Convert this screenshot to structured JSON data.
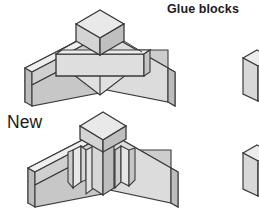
{
  "figure": {
    "title": "Glue blocks",
    "annotation_new": "New",
    "colors": {
      "background": "#ffffff",
      "outline": "#3a3a3a",
      "face_light": "#e6e6e6",
      "face_mid": "#d2d2d2",
      "face_dark": "#b9b9b9",
      "face_top": "#efefef",
      "text": "#1b1b1b"
    },
    "assemblies": [
      {
        "name": "upper-joint-assembly",
        "caption": "",
        "description": "Isometric V-shaped corner joint with two angled wing panels, a horizontal reinforcing beam across the inside and a small square block seated on the apex",
        "parts": [
          "left-wing-panel",
          "right-wing-panel",
          "horizontal-beam",
          "apex-cube"
        ]
      },
      {
        "name": "lower-joint-assembly",
        "caption": "New",
        "description": "Isometric V-shaped corner joint with two angled wing panels, a vertical corner post, four triangular glue blocks in the inside corners and a small square block on top",
        "parts": [
          "left-wing-panel",
          "right-wing-panel",
          "corner-post",
          "glue-block-left-outer",
          "glue-block-left-inner",
          "glue-block-right-inner",
          "glue-block-right-outer",
          "apex-cube"
        ]
      }
    ],
    "side_blocks": [
      {
        "name": "glue-block-sample-top",
        "description": "Small rectangular glue block shown at right edge, partially cropped"
      },
      {
        "name": "glue-block-sample-bottom",
        "description": "Small rectangular glue block shown at right edge, partially cropped"
      }
    ]
  }
}
